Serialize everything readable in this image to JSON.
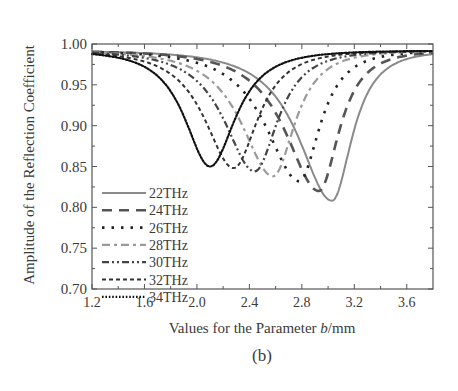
{
  "chart_data": {
    "type": "line",
    "title": "",
    "subfigure_label": "(b)",
    "xlabel_prefix": "Values for the Parameter ",
    "xlabel_italic": "b",
    "xlabel_suffix": "/mm",
    "ylabel": "Amplitude of the Reflection Coefficient",
    "xlim": [
      1.2,
      3.8
    ],
    "ylim": [
      0.7,
      1.0
    ],
    "xticks": [
      "1.2",
      "1.6",
      "2.0",
      "2.4",
      "2.8",
      "3.2",
      "3.6"
    ],
    "yticks": [
      "0.70",
      "0.75",
      "0.80",
      "0.85",
      "0.90",
      "0.95",
      "1.00"
    ],
    "grid": false,
    "legend_position": "lower left",
    "series": [
      {
        "name": "22THz",
        "style": "solid",
        "color": "#8a8a8a",
        "min_x": 3.03,
        "min_y": 0.808,
        "y_at_start": 0.988,
        "width_left": 0.55,
        "width_right": 0.33
      },
      {
        "name": "24THz",
        "style": "long-dash",
        "color": "#555555",
        "min_x": 2.93,
        "min_y": 0.82,
        "y_at_start": 0.987,
        "width_left": 0.55,
        "width_right": 0.33
      },
      {
        "name": "26THz",
        "style": "dot-spaced",
        "color": "#222222",
        "min_x": 2.78,
        "min_y": 0.832,
        "y_at_start": 0.986,
        "width_left": 0.55,
        "width_right": 0.34
      },
      {
        "name": "28THz",
        "style": "dash-dot",
        "color": "#9a9a9a",
        "min_x": 2.58,
        "min_y": 0.838,
        "y_at_start": 0.985,
        "width_left": 0.52,
        "width_right": 0.36
      },
      {
        "name": "30THz",
        "style": "dash-dot-dot",
        "color": "#444444",
        "min_x": 2.44,
        "min_y": 0.844,
        "y_at_start": 0.984,
        "width_left": 0.5,
        "width_right": 0.38
      },
      {
        "name": "32THz",
        "style": "short-dash",
        "color": "#333333",
        "min_x": 2.28,
        "min_y": 0.848,
        "y_at_start": 0.982,
        "width_left": 0.48,
        "width_right": 0.4
      },
      {
        "name": "34THz",
        "style": "dotted",
        "color": "#111111",
        "min_x": 2.1,
        "min_y": 0.85,
        "y_at_start": 0.979,
        "width_left": 0.42,
        "width_right": 0.42
      }
    ]
  }
}
